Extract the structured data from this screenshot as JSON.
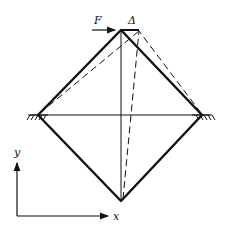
{
  "diagram": {
    "labels": {
      "force": "F",
      "displacement": "Δ",
      "x_axis": "x",
      "y_axis": "y"
    },
    "nodes": {
      "top": [
        121,
        30
      ],
      "left": [
        38,
        115
      ],
      "right": [
        202,
        115
      ],
      "bottom": [
        121,
        201
      ],
      "top_displaced": [
        139,
        30
      ]
    },
    "members": [
      "top-left",
      "top-right",
      "left-bottom",
      "right-bottom",
      "left-right (horizontal)",
      "top-bottom (vertical)"
    ],
    "supports": [
      "pinned left",
      "pinned right"
    ],
    "deformed_shape": "dashed",
    "colors": {
      "line": "#111111",
      "background": "#ffffff"
    }
  }
}
